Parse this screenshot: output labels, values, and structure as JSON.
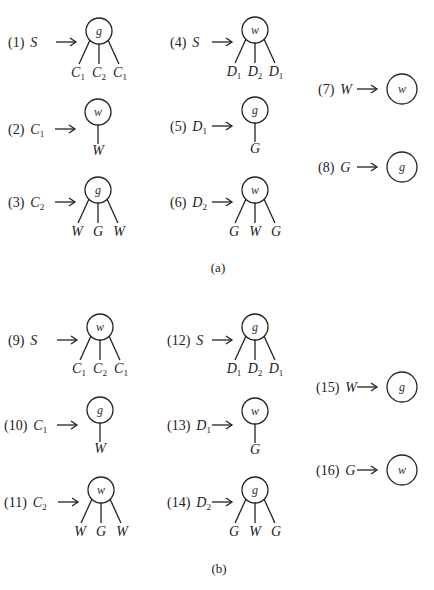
{
  "panels": [
    {
      "caption": "(a)",
      "caption_pos": [
        218,
        272
      ],
      "rules": [
        {
          "num": "(1)",
          "lhs": "S",
          "lhs_sub": "",
          "node": "g",
          "children": [
            [
              "C",
              "1"
            ],
            [
              "C",
              "2"
            ],
            [
              "C",
              "1"
            ]
          ],
          "cx": 99,
          "cy": 31,
          "lx": 8,
          "ly": 47
        },
        {
          "num": "(2)",
          "lhs": "C",
          "lhs_sub": "1",
          "node": "w",
          "children": [
            [
              "W",
              ""
            ]
          ],
          "cx": 98,
          "cy": 112,
          "lx": 8,
          "ly": 134
        },
        {
          "num": "(3)",
          "lhs": "C",
          "lhs_sub": "2",
          "node": "g",
          "children": [
            [
              "W",
              ""
            ],
            [
              "G",
              ""
            ],
            [
              "W",
              ""
            ]
          ],
          "cx": 98,
          "cy": 190,
          "lx": 8,
          "ly": 207
        },
        {
          "num": "(4)",
          "lhs": "S",
          "lhs_sub": "",
          "node": "w",
          "children": [
            [
              "D",
              "1"
            ],
            [
              "D",
              "2"
            ],
            [
              "D",
              "1"
            ]
          ],
          "cx": 255,
          "cy": 30,
          "lx": 170,
          "ly": 47
        },
        {
          "num": "(5)",
          "lhs": "D",
          "lhs_sub": "1",
          "node": "g",
          "children": [
            [
              "G",
              ""
            ]
          ],
          "cx": 255,
          "cy": 110,
          "lx": 170,
          "ly": 131
        },
        {
          "num": "(6)",
          "lhs": "D",
          "lhs_sub": "2",
          "node": "w",
          "children": [
            [
              "G",
              ""
            ],
            [
              "W",
              ""
            ],
            [
              "G",
              ""
            ]
          ],
          "cx": 255,
          "cy": 190,
          "lx": 170,
          "ly": 207
        },
        {
          "num": "(7)",
          "lhs": "W",
          "lhs_sub": "",
          "node": "w",
          "children": [],
          "cx": 402,
          "cy": 89,
          "lx": 318,
          "ly": 94
        },
        {
          "num": "(8)",
          "lhs": "G",
          "lhs_sub": "",
          "node": "g",
          "children": [],
          "cx": 402,
          "cy": 167,
          "lx": 318,
          "ly": 172
        }
      ]
    },
    {
      "caption": "(b)",
      "caption_pos": [
        219,
        573
      ],
      "rules": [
        {
          "num": "(9)",
          "lhs": "S",
          "lhs_sub": "",
          "node": "w",
          "children": [
            [
              "C",
              "1"
            ],
            [
              "C",
              "2"
            ],
            [
              "C",
              "1"
            ]
          ],
          "cx": 100,
          "cy": 327,
          "lx": 8,
          "ly": 345
        },
        {
          "num": "(10)",
          "lhs": "C",
          "lhs_sub": "1",
          "node": "g",
          "children": [
            [
              "W",
              ""
            ]
          ],
          "cx": 100,
          "cy": 410,
          "lx": 4,
          "ly": 430
        },
        {
          "num": "(11)",
          "lhs": "C",
          "lhs_sub": "2",
          "node": "w",
          "children": [
            [
              "W",
              ""
            ],
            [
              "G",
              ""
            ],
            [
              "W",
              ""
            ]
          ],
          "cx": 101,
          "cy": 490,
          "lx": 4,
          "ly": 507
        },
        {
          "num": "(12)",
          "lhs": "S",
          "lhs_sub": "",
          "node": "g",
          "children": [
            [
              "D",
              "1"
            ],
            [
              "D",
              "2"
            ],
            [
              "D",
              "1"
            ]
          ],
          "cx": 255,
          "cy": 327,
          "lx": 167,
          "ly": 345
        },
        {
          "num": "(13)",
          "lhs": "D",
          "lhs_sub": "1",
          "node": "w",
          "children": [
            [
              "G",
              ""
            ]
          ],
          "cx": 255,
          "cy": 411,
          "lx": 167,
          "ly": 430
        },
        {
          "num": "(14)",
          "lhs": "D",
          "lhs_sub": "2",
          "node": "g",
          "children": [
            [
              "G",
              ""
            ],
            [
              "W",
              ""
            ],
            [
              "G",
              ""
            ]
          ],
          "cx": 255,
          "cy": 490,
          "lx": 167,
          "ly": 507
        },
        {
          "num": "(15)",
          "lhs": "W",
          "lhs_sub": "",
          "node": "g",
          "children": [],
          "cx": 402,
          "cy": 387,
          "lx": 316,
          "ly": 392
        },
        {
          "num": "(16)",
          "lhs": "G",
          "lhs_sub": "",
          "node": "w",
          "children": [],
          "cx": 402,
          "cy": 470,
          "lx": 316,
          "ly": 475
        }
      ]
    }
  ]
}
